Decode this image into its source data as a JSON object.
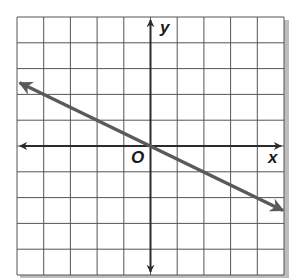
{
  "figure": {
    "type": "coordinate-plane-graph",
    "grid": {
      "columns": 10,
      "rows": 10,
      "x_range": [
        -5,
        5
      ],
      "y_range": [
        -5,
        5
      ],
      "line_color": "#555555",
      "background": "#ffffff"
    },
    "axes": {
      "x_label": "x",
      "y_label": "y",
      "origin_label": "O",
      "color": "#2b2b2b"
    },
    "line": {
      "equation": "y = -x/2",
      "slope": -0.5,
      "intercept": 0,
      "from": [
        -4.9,
        2.45
      ],
      "to": [
        5.0,
        -2.5
      ],
      "color": "#5a5a5a",
      "arrows": "both"
    }
  }
}
